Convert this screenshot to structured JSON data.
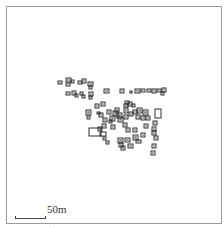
{
  "map": {
    "type": "site-plan",
    "description": "Building footprints clustered in center of map",
    "scale": {
      "label": "50m",
      "length_px": 31
    },
    "colors": {
      "outline": "#1a1a1a",
      "frame": "#9a9a9a",
      "background": "#ffffff"
    },
    "buildings": [
      [
        58,
        81,
        4,
        3
      ],
      [
        66,
        78,
        5,
        4
      ],
      [
        66,
        83,
        4,
        3
      ],
      [
        71,
        80,
        3,
        3
      ],
      [
        78,
        81,
        4,
        3
      ],
      [
        82,
        79,
        4,
        4
      ],
      [
        88,
        82,
        5,
        4
      ],
      [
        89,
        86,
        3,
        3
      ],
      [
        66,
        92,
        4,
        3
      ],
      [
        72,
        91,
        4,
        4
      ],
      [
        75,
        94,
        3,
        3
      ],
      [
        80,
        92,
        3,
        3
      ],
      [
        82,
        95,
        3,
        3
      ],
      [
        89,
        92,
        4,
        4
      ],
      [
        89,
        96,
        3,
        3
      ],
      [
        104,
        89,
        5,
        4
      ],
      [
        120,
        89,
        4,
        4
      ],
      [
        130,
        91,
        2,
        2
      ],
      [
        135,
        89,
        5,
        4
      ],
      [
        141,
        89,
        4,
        3
      ],
      [
        147,
        89,
        4,
        3
      ],
      [
        152,
        89,
        4,
        4
      ],
      [
        157,
        89,
        4,
        3
      ],
      [
        162,
        88,
        4,
        4
      ],
      [
        161,
        92,
        3,
        3
      ],
      [
        86,
        110,
        5,
        5
      ],
      [
        87,
        116,
        3,
        3
      ],
      [
        95,
        104,
        4,
        4
      ],
      [
        101,
        102,
        4,
        4
      ],
      [
        99,
        113,
        4,
        4
      ],
      [
        107,
        110,
        4,
        4
      ],
      [
        103,
        118,
        4,
        4
      ],
      [
        97,
        112,
        3,
        2
      ],
      [
        110,
        116,
        5,
        5
      ],
      [
        113,
        111,
        5,
        5
      ],
      [
        115,
        108,
        4,
        4
      ],
      [
        117,
        113,
        5,
        5
      ],
      [
        118,
        117,
        5,
        5
      ],
      [
        124,
        104,
        4,
        3
      ],
      [
        125,
        101,
        4,
        3
      ],
      [
        124,
        108,
        4,
        5
      ],
      [
        124,
        115,
        4,
        4
      ],
      [
        129,
        112,
        4,
        4
      ],
      [
        128,
        102,
        4,
        4
      ],
      [
        132,
        104,
        3,
        3
      ],
      [
        133,
        110,
        4,
        4
      ],
      [
        137,
        108,
        5,
        5
      ],
      [
        136,
        115,
        4,
        4
      ],
      [
        141,
        116,
        4,
        4
      ],
      [
        143,
        110,
        5,
        5
      ],
      [
        146,
        116,
        4,
        4
      ],
      [
        155,
        109,
        6,
        9
      ],
      [
        102,
        124,
        4,
        4
      ],
      [
        98,
        127,
        4,
        4
      ],
      [
        109,
        120,
        3,
        3
      ],
      [
        111,
        125,
        4,
        4
      ],
      [
        123,
        123,
        4,
        4
      ],
      [
        126,
        128,
        4,
        4
      ],
      [
        133,
        128,
        4,
        4
      ],
      [
        144,
        124,
        4,
        4
      ],
      [
        153,
        121,
        4,
        4
      ],
      [
        152,
        127,
        4,
        4
      ],
      [
        89,
        128,
        12,
        8
      ],
      [
        100,
        132,
        6,
        4
      ],
      [
        103,
        137,
        3,
        3
      ],
      [
        106,
        141,
        3,
        3
      ],
      [
        118,
        138,
        5,
        5
      ],
      [
        119,
        143,
        4,
        4
      ],
      [
        121,
        146,
        4,
        4
      ],
      [
        125,
        138,
        5,
        4
      ],
      [
        128,
        144,
        5,
        4
      ],
      [
        133,
        135,
        5,
        5
      ],
      [
        136,
        140,
        5,
        3
      ],
      [
        141,
        133,
        4,
        4
      ],
      [
        152,
        131,
        4,
        4
      ],
      [
        154,
        136,
        4,
        4
      ],
      [
        152,
        144,
        4,
        4
      ],
      [
        151,
        151,
        4,
        4
      ]
    ],
    "footer": {
      "left": "· ·",
      "right": ""
    }
  }
}
